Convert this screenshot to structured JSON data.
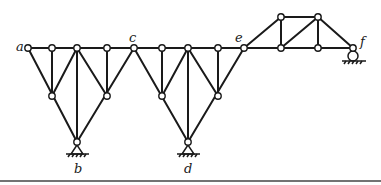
{
  "diagram": {
    "type": "truss",
    "labels": {
      "a": "a",
      "b": "b",
      "c": "c",
      "d": "d",
      "e": "e",
      "f": "f"
    },
    "supports": [
      {
        "node": "b",
        "type": "pin"
      },
      {
        "node": "d",
        "type": "pin"
      },
      {
        "node": "f",
        "type": "roller"
      }
    ],
    "colors": {
      "member": "#1a1a1a",
      "node_fill": "#ffffff"
    }
  }
}
